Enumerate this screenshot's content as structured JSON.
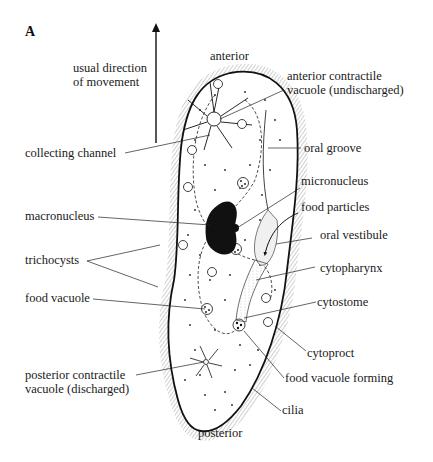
{
  "figure": {
    "panel_letter": "A",
    "colors": {
      "ink": "#1a1a1a",
      "background": "#ffffff",
      "cilia": "#555555"
    }
  },
  "orientation": {
    "arrow_label_line1": "usual direction",
    "arrow_label_line2": "of movement",
    "top": "anterior",
    "bottom": "posterior"
  },
  "labels_left": {
    "collecting_channel": "collecting channel",
    "macronucleus": "macronucleus",
    "trichocysts": "trichocysts",
    "food_vacuole": "food vacuole",
    "posterior_cv_line1": "posterior contractile",
    "posterior_cv_line2": "vacuole (discharged)"
  },
  "labels_right": {
    "anterior_cv_line1": "anterior contractile",
    "anterior_cv_line2": "vacuole (undischarged)",
    "oral_groove": "oral groove",
    "micronucleus": "micronucleus",
    "food_particles": "food particles",
    "oral_vestibule": "oral vestibule",
    "cytopharynx": "cytopharynx",
    "cytostome": "cytostome",
    "cytoproct": "cytoproct",
    "food_vacuole_forming": "food vacuole forming",
    "cilia": "cilia"
  }
}
